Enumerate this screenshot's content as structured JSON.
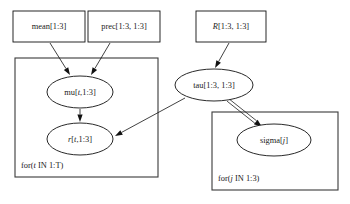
{
  "diagram": {
    "background_color": "#ffffff",
    "node_stroke_color": "#111111",
    "plate_stroke_color": "#3a3a3a",
    "text_color": "#1a1a1a",
    "rect_nodes": [
      {
        "id": "mean",
        "label_parts": [
          {
            "text": "mean[1:3]",
            "italic": false
          }
        ],
        "label_plain": "mean[1:3]",
        "x": 13,
        "y": 11,
        "w": 72,
        "h": 31
      },
      {
        "id": "prec",
        "label_parts": [
          {
            "text": "prec[1:3, 1:3]",
            "italic": false
          }
        ],
        "label_plain": "prec[1:3, 1:3]",
        "x": 88,
        "y": 11,
        "w": 72,
        "h": 31
      },
      {
        "id": "R",
        "label_parts": [
          {
            "text": "R",
            "italic": true
          },
          {
            "text": "[1:3, 1:3]",
            "italic": false
          }
        ],
        "label_plain": "R[1:3, 1:3]",
        "x": 196,
        "y": 11,
        "w": 70,
        "h": 31
      }
    ],
    "ellipse_nodes": [
      {
        "id": "mu",
        "label_parts": [
          {
            "text": "mu[",
            "italic": false
          },
          {
            "text": "t",
            "italic": true
          },
          {
            "text": ",1:3]",
            "italic": false
          }
        ],
        "label_plain": "mu[t,1:3]",
        "cx": 80,
        "cy": 92,
        "rx": 33,
        "ry": 16
      },
      {
        "id": "r",
        "label_parts": [
          {
            "text": "r",
            "italic": true
          },
          {
            "text": "[",
            "italic": false
          },
          {
            "text": "t",
            "italic": true
          },
          {
            "text": ",1:3]",
            "italic": false
          }
        ],
        "label_plain": "r[t,1:3]",
        "cx": 80,
        "cy": 139,
        "rx": 33,
        "ry": 16
      },
      {
        "id": "tau",
        "label_parts": [
          {
            "text": "tau[1:3, 1:3]",
            "italic": false
          }
        ],
        "label_plain": "tau[1:3, 1:3]",
        "cx": 214,
        "cy": 85,
        "rx": 39,
        "ry": 16
      },
      {
        "id": "sigma",
        "label_parts": [
          {
            "text": "sigma[",
            "italic": false
          },
          {
            "text": "j",
            "italic": true
          },
          {
            "text": "]",
            "italic": false
          }
        ],
        "label_plain": "sigma[j]",
        "cx": 274,
        "cy": 140,
        "rx": 37,
        "ry": 16
      }
    ],
    "plates": [
      {
        "id": "t-plate",
        "label_parts": [
          {
            "text": "for(",
            "italic": false
          },
          {
            "text": "t",
            "italic": true
          },
          {
            "text": " IN 1:T)",
            "italic": false
          }
        ],
        "label_plain": "for(t IN 1:T)",
        "x": 15,
        "y": 58,
        "w": 143,
        "h": 119,
        "label_x": 21,
        "label_y": 166
      },
      {
        "id": "j-plate",
        "label_parts": [
          {
            "text": "for(",
            "italic": false
          },
          {
            "text": "j",
            "italic": true
          },
          {
            "text": " IN 1:3)",
            "italic": false
          }
        ],
        "label_plain": "for(j IN 1:3)",
        "x": 212,
        "y": 112,
        "w": 126,
        "h": 78,
        "label_x": 218,
        "label_y": 179
      }
    ],
    "edges": [
      {
        "id": "mean-to-mu",
        "from": "mean",
        "to": "mu",
        "style": "solid-arrow",
        "x1": 50,
        "y1": 43,
        "x2": 70,
        "y2": 75
      },
      {
        "id": "prec-to-mu",
        "from": "prec",
        "to": "mu",
        "style": "solid-arrow",
        "x1": 110,
        "y1": 43,
        "x2": 91,
        "y2": 75
      },
      {
        "id": "mu-to-r",
        "from": "mu",
        "to": "r",
        "style": "solid-arrow",
        "x1": 80,
        "y1": 109,
        "x2": 80,
        "y2": 122
      },
      {
        "id": "R-to-tau",
        "from": "R",
        "to": "tau",
        "style": "solid-arrow",
        "x1": 229,
        "y1": 43,
        "x2": 215,
        "y2": 68
      },
      {
        "id": "tau-to-r",
        "from": "tau",
        "to": "r",
        "style": "solid-arrow",
        "x1": 185,
        "y1": 98,
        "x2": 115,
        "y2": 136
      },
      {
        "id": "tau-to-sigma",
        "from": "tau",
        "to": "sigma",
        "style": "hollow-double-arrow",
        "x1": 228,
        "y1": 100,
        "x2": 262,
        "y2": 127
      }
    ]
  }
}
